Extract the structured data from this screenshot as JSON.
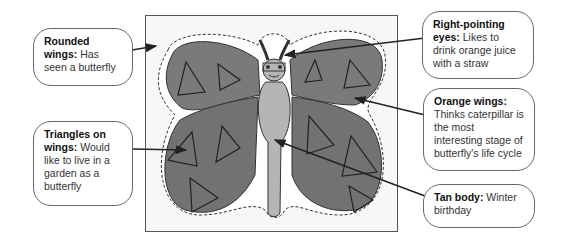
{
  "figure": {
    "colors": {
      "wing_fill": "#7a7a7a",
      "body_fill": "#b5b5b5",
      "frame": "#555555",
      "arrow": "#222222"
    }
  },
  "callouts": [
    {
      "id": "rounded-wings",
      "title": "Rounded wings:",
      "text": "Has seen a butterfly"
    },
    {
      "id": "triangles-on-wings",
      "title": "Triangles on wings:",
      "text": "Would like to live in a garden as a butterfly"
    },
    {
      "id": "right-pointing-eyes",
      "title": "Right-pointing eyes:",
      "text": "Likes to drink orange juice with a straw"
    },
    {
      "id": "orange-wings",
      "title": "Orange wings:",
      "text": "Thinks caterpillar is the most interesting stage of butterfly's life cycle"
    },
    {
      "id": "tan-body",
      "title": "Tan body:",
      "text": "Winter birthday"
    }
  ]
}
